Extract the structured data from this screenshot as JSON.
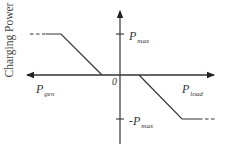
{
  "diagram": {
    "type": "piecewise-linear characteristic",
    "y_axis_label": "Charging Power",
    "origin_label": "0",
    "x_left_label": {
      "base": "P",
      "sub": "gen"
    },
    "x_right_label": {
      "base": "P",
      "sub": "load"
    },
    "y_top_label": {
      "base": "P",
      "sub": "max"
    },
    "y_bottom_label": {
      "base": "-P",
      "sub": "max"
    },
    "colors": {
      "line": "#333333",
      "axis": "#333333",
      "text": "#333333",
      "background": "#ffffff"
    },
    "curve": {
      "left_segment": "constant at P_max (dashed extension to the left), then ramps linearly down to 0 before the origin",
      "dead_zone": "zero between the left and right breakpoints around the origin",
      "right_segment": "ramps linearly down from 0 after the origin to -P_max, then constant (dashed extension to the right)"
    }
  }
}
